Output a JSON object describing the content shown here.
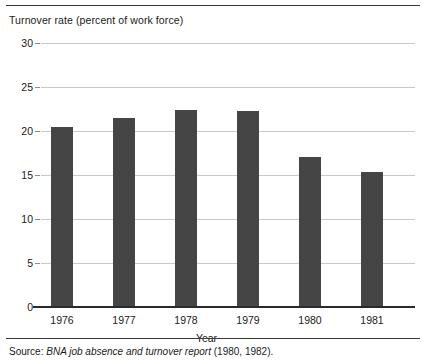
{
  "figure": {
    "title": "Turnover rate (percent of work force)",
    "source_prefix": "Source:",
    "source_title": "BNA job absence and turnover report",
    "source_years": "(1980, 1982)."
  },
  "chart_data": {
    "type": "bar",
    "title": "Turnover rate (percent of work force)",
    "xlabel": "Year",
    "ylabel": "Turnover rate (percent of work force)",
    "categories": [
      "1976",
      "1977",
      "1978",
      "1979",
      "1980",
      "1981"
    ],
    "values": [
      20.4,
      21.5,
      22.4,
      22.3,
      17.0,
      15.3
    ],
    "ylim": [
      0,
      30
    ],
    "yticks": [
      0,
      5,
      10,
      15,
      20,
      25,
      30
    ],
    "ytick_labels": [
      "0",
      "5",
      "10",
      "15",
      "20",
      "25",
      "30"
    ],
    "grid": true,
    "legend": false,
    "bar_color": "#454545",
    "gridline_color": "#c8c8c8",
    "axis_color": "#2b2b2b"
  }
}
